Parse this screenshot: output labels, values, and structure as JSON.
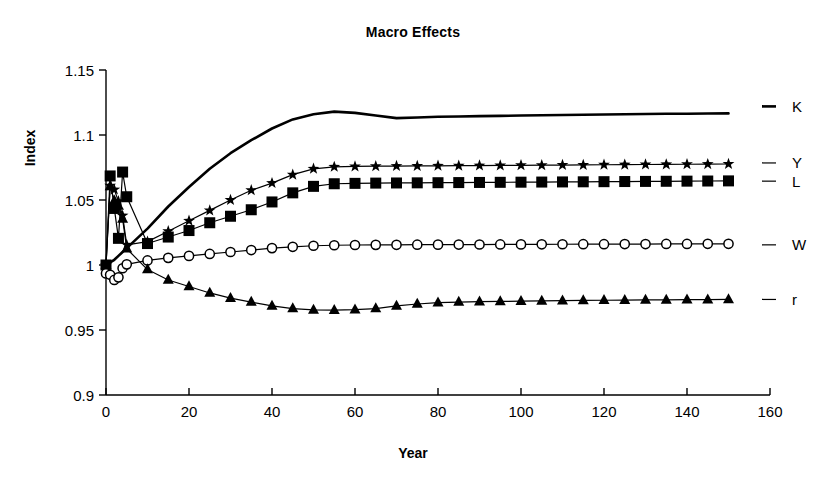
{
  "chart_data": {
    "type": "line",
    "title": "Macro Effects",
    "xlabel": "Year",
    "ylabel": "Index",
    "xlim": [
      0,
      160
    ],
    "ylim": [
      0.9,
      1.15
    ],
    "xticks": [
      0,
      20,
      40,
      60,
      80,
      100,
      120,
      140,
      160
    ],
    "xtick_labels": [
      "0",
      "20",
      "40",
      "60",
      "80",
      "100",
      "120",
      "140",
      "160"
    ],
    "yticks": [
      0.9,
      0.95,
      1,
      1.05,
      1.1,
      1.15
    ],
    "ytick_labels": [
      "0.9",
      "0.95",
      "1",
      "1.05",
      "1.1",
      "1.15"
    ],
    "grid": false,
    "legend_position": "right-of-axes-inline",
    "x": [
      0,
      1,
      2,
      3,
      4,
      5,
      10,
      15,
      20,
      25,
      30,
      35,
      40,
      45,
      50,
      55,
      60,
      65,
      70,
      75,
      80,
      85,
      90,
      95,
      100,
      105,
      110,
      115,
      120,
      125,
      130,
      135,
      140,
      145,
      150
    ],
    "series": [
      {
        "name": "K",
        "label": "K",
        "marker": "none",
        "line_width": "thick",
        "color": "#000000",
        "label_y_value": 1.122,
        "values": [
          1.0,
          1.002,
          1.004,
          1.007,
          1.01,
          1.013,
          1.028,
          1.045,
          1.06,
          1.074,
          1.086,
          1.096,
          1.105,
          1.112,
          1.116,
          1.118,
          1.117,
          1.115,
          1.113,
          1.1135,
          1.114,
          1.1142,
          1.1145,
          1.1147,
          1.115,
          1.1152,
          1.1154,
          1.1156,
          1.1158,
          1.116,
          1.1162,
          1.1163,
          1.1164,
          1.1165,
          1.1166
        ]
      },
      {
        "name": "Y",
        "label": "Y",
        "marker": "star",
        "line_width": "thin",
        "color": "#000000",
        "label_y_value": 1.0785,
        "values": [
          1.0,
          1.061,
          1.058,
          1.049,
          1.038,
          1.0155,
          1.018,
          1.026,
          1.034,
          1.042,
          1.05,
          1.0575,
          1.063,
          1.0695,
          1.074,
          1.0755,
          1.0758,
          1.076,
          1.0761,
          1.0762,
          1.0763,
          1.0764,
          1.0765,
          1.0766,
          1.0767,
          1.0768,
          1.0769,
          1.077,
          1.0771,
          1.0772,
          1.0773,
          1.0774,
          1.0775,
          1.0776,
          1.0777
        ]
      },
      {
        "name": "L",
        "label": "L",
        "marker": "square",
        "line_width": "thin",
        "color": "#000000",
        "label_y_value": 1.0645,
        "values": [
          1.0,
          1.0685,
          1.0435,
          1.0205,
          1.0715,
          1.0525,
          1.0165,
          1.0215,
          1.0265,
          1.0325,
          1.0375,
          1.0425,
          1.0485,
          1.0555,
          1.0605,
          1.0625,
          1.0628,
          1.063,
          1.0631,
          1.0632,
          1.0633,
          1.0634,
          1.0635,
          1.0636,
          1.0637,
          1.0638,
          1.0639,
          1.064,
          1.0641,
          1.0642,
          1.0643,
          1.0644,
          1.0645,
          1.0646,
          1.0647
        ]
      },
      {
        "name": "W",
        "label": "W",
        "marker": "circle",
        "line_width": "thin",
        "color": "#000000",
        "label_y_value": 1.0155,
        "values": [
          0.9935,
          0.9925,
          0.9885,
          0.9905,
          0.9975,
          1.0005,
          1.0035,
          1.0055,
          1.007,
          1.0085,
          1.01,
          1.0115,
          1.013,
          1.014,
          1.0148,
          1.0152,
          1.0154,
          1.0155,
          1.01555,
          1.0156,
          1.01565,
          1.0157,
          1.01575,
          1.0158,
          1.01585,
          1.0159,
          1.01595,
          1.016,
          1.016,
          1.0161,
          1.0161,
          1.0162,
          1.0162,
          1.0163,
          1.0163
        ]
      },
      {
        "name": "r",
        "label": "r",
        "marker": "triangle",
        "line_width": "thin",
        "color": "#000000",
        "label_y_value": 0.9735,
        "values": [
          1.0,
          1.0605,
          1.0495,
          1.0455,
          1.0355,
          1.0125,
          0.9965,
          0.9885,
          0.9835,
          0.9785,
          0.9745,
          0.9715,
          0.9685,
          0.9665,
          0.9655,
          0.9653,
          0.9656,
          0.9665,
          0.9685,
          0.97,
          0.971,
          0.9715,
          0.9718,
          0.972,
          0.9722,
          0.9724,
          0.9726,
          0.9728,
          0.9729,
          0.973,
          0.9731,
          0.9732,
          0.9733,
          0.9734,
          0.9735
        ]
      }
    ]
  }
}
